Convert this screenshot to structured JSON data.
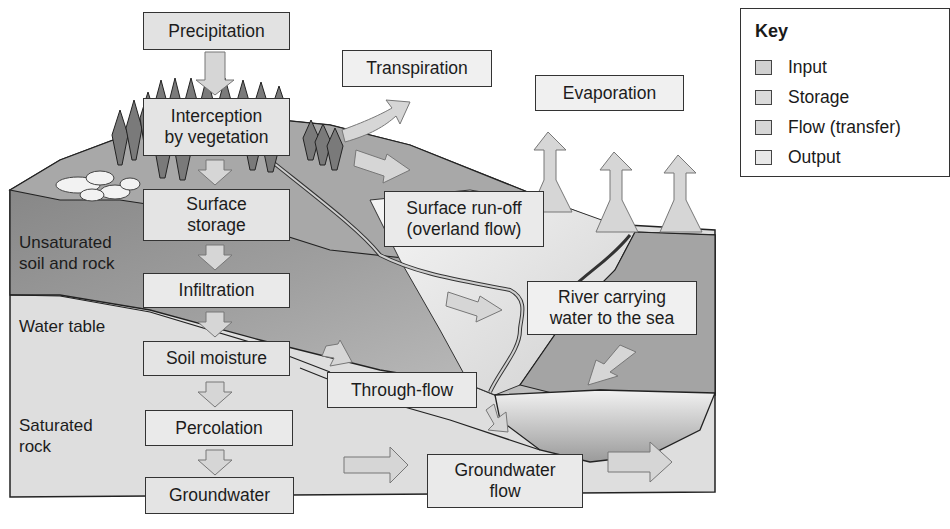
{
  "diagram": {
    "colors": {
      "background": "#ffffff",
      "land_dark": "#8a8a8a",
      "land_mid": "#b0b0b0",
      "land_light": "#d6d6d6",
      "saturated_rock": "#dcdcdc",
      "arrow_fill": "#d4d4d4",
      "box_border": "#333333"
    },
    "labels": {
      "precipitation": "Precipitation",
      "interception": "Interception\nby vegetation",
      "transpiration": "Transpiration",
      "evaporation": "Evaporation",
      "surface_storage": "Surface\nstorage",
      "surface_runoff": "Surface run-off\n(overland flow)",
      "infiltration": "Infiltration",
      "river": "River carrying\nwater to the sea",
      "soil_moisture": "Soil moisture",
      "through_flow": "Through-flow",
      "percolation": "Percolation",
      "groundwater": "Groundwater",
      "groundwater_flow": "Groundwater\nflow"
    },
    "zones": {
      "unsaturated": "Unsaturated\nsoil and rock",
      "water_table": "Water table",
      "saturated": "Saturated\nrock"
    }
  },
  "key": {
    "title": "Key",
    "items": [
      {
        "label": "Input",
        "color": "#d0d0d0"
      },
      {
        "label": "Storage",
        "color": "#dadada"
      },
      {
        "label": "Flow (transfer)",
        "color": "#d6d6d6"
      },
      {
        "label": "Output",
        "color": "#e8e8e8"
      }
    ]
  }
}
